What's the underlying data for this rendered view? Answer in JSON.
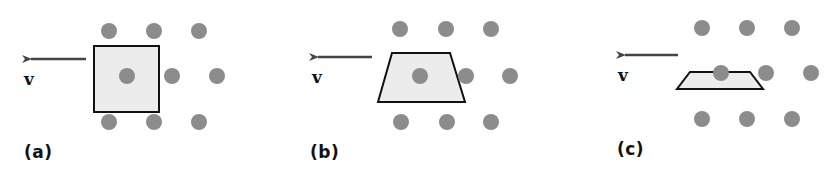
{
  "colors": {
    "background": "#ffffff",
    "dot": "#8c8c8c",
    "shape_fill": "#ececec",
    "shape_stroke": "#111111",
    "arrow": "#444444"
  },
  "panels": [
    {
      "label": "(a)",
      "velocity_label": "v",
      "shape": "square",
      "arrow": {
        "x1": 86,
        "y1": 59,
        "x2": 23,
        "y2": 59
      },
      "shape_points": "94,46 159,46 159,112 94,112",
      "dots": [
        [
          109,
          31
        ],
        [
          154,
          31
        ],
        [
          199,
          31
        ],
        [
          127,
          76
        ],
        [
          172,
          76
        ],
        [
          217,
          76
        ],
        [
          109,
          122
        ],
        [
          154,
          122
        ],
        [
          199,
          122
        ]
      ],
      "label_pos": [
        24,
        142
      ],
      "v_pos": [
        24,
        69
      ]
    },
    {
      "label": "(b)",
      "velocity_label": "v",
      "shape": "trapezoid",
      "arrow": {
        "x1": 372,
        "y1": 57,
        "x2": 310,
        "y2": 57
      },
      "shape_points": "392,53 450,53 465,102 378,102",
      "dots": [
        [
          400,
          29
        ],
        [
          446,
          29
        ],
        [
          491,
          29
        ],
        [
          420,
          76
        ],
        [
          466,
          76
        ],
        [
          510,
          76
        ],
        [
          401,
          122
        ],
        [
          447,
          122
        ],
        [
          491,
          122
        ]
      ],
      "label_pos": [
        310,
        142
      ],
      "v_pos": [
        312,
        67
      ]
    },
    {
      "label": "(c)",
      "velocity_label": "v",
      "shape": "flat-trapezoid",
      "arrow": {
        "x1": 678,
        "y1": 55,
        "x2": 617,
        "y2": 55
      },
      "shape_points": "690,72 750,72 763,89 677,89",
      "dots": [
        [
          702,
          28
        ],
        [
          747,
          28
        ],
        [
          792,
          28
        ],
        [
          721,
          73
        ],
        [
          766,
          73
        ],
        [
          811,
          73
        ],
        [
          702,
          119
        ],
        [
          747,
          119
        ],
        [
          792,
          119
        ]
      ],
      "label_pos": [
        617,
        139
      ],
      "v_pos": [
        618,
        65
      ]
    }
  ]
}
